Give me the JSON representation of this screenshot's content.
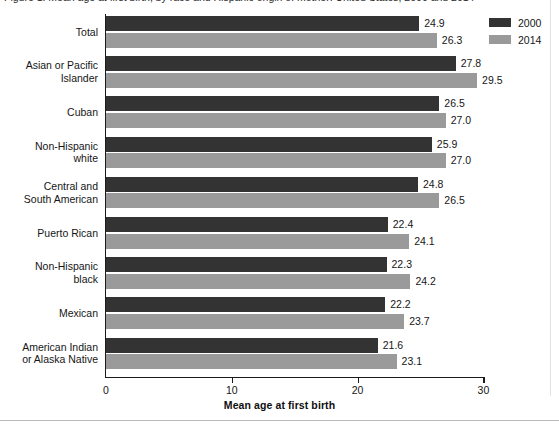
{
  "figure": {
    "caption": "Figure 1. Mean age at first birth, by race and Hispanic origin of mother: United States, 2000 and 2014"
  },
  "chart_data": {
    "type": "bar",
    "orientation": "horizontal",
    "title": "",
    "xlabel": "Mean age at first birth",
    "ylabel": "",
    "xlim": [
      0,
      30
    ],
    "xticks": [
      0,
      10,
      20,
      30
    ],
    "xtick_labels": [
      "0",
      "10",
      "20",
      "30"
    ],
    "grid": false,
    "legend_position": "top-right",
    "categories": [
      "Total",
      "Asian or Pacific Islander",
      "Cuban",
      "Non-Hispanic white",
      "Central and South American",
      "Puerto Rican",
      "Non-Hispanic black",
      "Mexican",
      "American Indian or Alaska Native"
    ],
    "category_label_lines": [
      [
        "Total"
      ],
      [
        "Asian or Pacific",
        "Islander"
      ],
      [
        "Cuban"
      ],
      [
        "Non-Hispanic",
        "white"
      ],
      [
        "Central and",
        "South American"
      ],
      [
        "Puerto Rican"
      ],
      [
        "Non-Hispanic",
        "black"
      ],
      [
        "Mexican"
      ],
      [
        "American Indian",
        "or Alaska Native"
      ]
    ],
    "series": [
      {
        "name": "2000",
        "color": "#333333",
        "values": [
          24.9,
          27.8,
          26.5,
          25.9,
          24.8,
          22.4,
          22.3,
          22.2,
          21.6
        ],
        "value_labels": [
          "24.9",
          "27.8",
          "26.5",
          "25.9",
          "24.8",
          "22.4",
          "22.3",
          "22.2",
          "21.6"
        ]
      },
      {
        "name": "2014",
        "color": "#9a9a9a",
        "values": [
          26.3,
          29.5,
          27.0,
          27.0,
          26.5,
          24.1,
          24.2,
          23.7,
          23.1
        ],
        "value_labels": [
          "26.3",
          "29.5",
          "27.0",
          "27.0",
          "26.5",
          "24.1",
          "24.2",
          "23.7",
          "23.1"
        ]
      }
    ]
  },
  "legend": {
    "items": [
      {
        "label": "2000",
        "color": "#333333"
      },
      {
        "label": "2014",
        "color": "#9a9a9a"
      }
    ]
  }
}
